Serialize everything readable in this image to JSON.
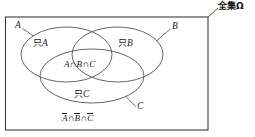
{
  "figure": {
    "type": "venn-diagram-three-sets",
    "universal_set_label": "全集Ω",
    "set_labels": {
      "a": "A",
      "b": "B",
      "c": "C"
    },
    "region_labels": {
      "only_a": "只",
      "only_a_set": "A",
      "only_b": "只",
      "only_b_set": "B",
      "only_c": "只",
      "only_c_set": "C",
      "triple_intersection_a": "A",
      "triple_intersection_op1": "∩",
      "triple_intersection_b": "B",
      "triple_intersection_op2": "∩",
      "triple_intersection_c": "C",
      "complement_a": "A",
      "complement_op1": "∩",
      "complement_b": "B",
      "complement_op2": "∩",
      "complement_c": "C"
    },
    "colors": {
      "stroke": "#4a4a4a",
      "frame_stroke": "#3c3c3c",
      "text": "#1a1a1a",
      "background": "#ffffff"
    }
  }
}
